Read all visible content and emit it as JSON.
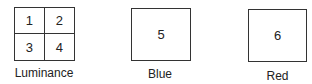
{
  "diagram": {
    "luminance": {
      "label": "Luminance",
      "cells": [
        "1",
        "2",
        "3",
        "4"
      ]
    },
    "blue": {
      "label": "Blue",
      "value": "5"
    },
    "red": {
      "label": "Red",
      "value": "6"
    },
    "colors": {
      "stroke": "#333333",
      "text": "#222222",
      "background": "#ffffff"
    }
  }
}
